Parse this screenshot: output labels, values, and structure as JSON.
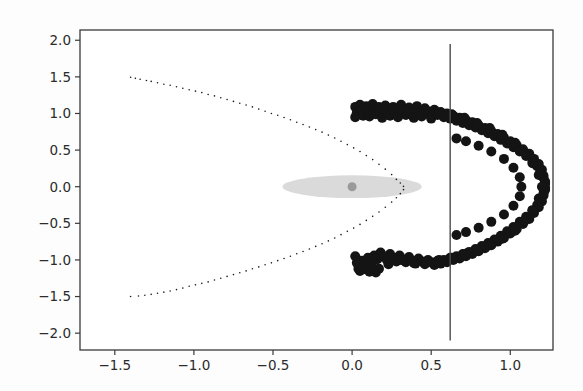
{
  "figure": {
    "background": "#fdfdfd",
    "width": 583,
    "height": 391,
    "frame_color": "#3a3a3a"
  },
  "chart_data": {
    "type": "scatter",
    "title": "",
    "xlabel": "",
    "ylabel": "",
    "xlim": [
      -1.72,
      1.27
    ],
    "ylim": [
      -2.23,
      2.14
    ],
    "grid": false,
    "legend": null,
    "xticks": [
      -1.5,
      -1.0,
      -0.5,
      0.0,
      0.5,
      1.0
    ],
    "xtick_labels": [
      "-1.5",
      "-1.0",
      "-0.5",
      "0.0",
      "0.5",
      "1.0"
    ],
    "yticks": [
      2.0,
      1.5,
      1.0,
      0.5,
      0.0,
      -0.5,
      -1.0,
      -1.5,
      -2.0
    ],
    "ytick_labels": [
      "2.0",
      "1.5",
      "1.0",
      "0.5",
      "0.0",
      "-0.5",
      "-1.0",
      "-1.5",
      "-2.0"
    ],
    "series": [
      {
        "name": "parabola-points",
        "marker": "small-dot",
        "color": "#1a1a1a",
        "size": 1.6,
        "description": "sparse small dots tracing a leftward-opening parabola x = 0.33 - 0.83*y^2",
        "points": [
          [
            -1.4,
            1.495
          ],
          [
            -1.37,
            1.48
          ],
          [
            -1.34,
            1.468
          ],
          [
            -1.3,
            1.45
          ],
          [
            -1.27,
            1.438
          ],
          [
            -1.23,
            1.42
          ],
          [
            -1.19,
            1.4
          ],
          [
            -1.15,
            1.385
          ],
          [
            -1.11,
            1.365
          ],
          [
            -1.07,
            1.345
          ],
          [
            -1.03,
            1.325
          ],
          [
            -0.99,
            1.305
          ],
          [
            -0.95,
            1.285
          ],
          [
            -0.91,
            1.26
          ],
          [
            -0.87,
            1.24
          ],
          [
            -0.83,
            1.215
          ],
          [
            -0.79,
            1.19
          ],
          [
            -0.75,
            1.165
          ],
          [
            -0.71,
            1.14
          ],
          [
            -0.67,
            1.115
          ],
          [
            -0.63,
            1.09
          ],
          [
            -0.59,
            1.06
          ],
          [
            -0.55,
            1.03
          ],
          [
            -0.51,
            1.0
          ],
          [
            -0.47,
            0.975
          ],
          [
            -0.43,
            0.945
          ],
          [
            -0.39,
            0.915
          ],
          [
            -0.35,
            0.88
          ],
          [
            -0.31,
            0.85
          ],
          [
            -0.27,
            0.815
          ],
          [
            -0.23,
            0.78
          ],
          [
            -0.19,
            0.745
          ],
          [
            -0.15,
            0.705
          ],
          [
            -0.11,
            0.665
          ],
          [
            -0.07,
            0.62
          ],
          [
            -0.03,
            0.575
          ],
          [
            0.01,
            0.53
          ],
          [
            0.05,
            0.48
          ],
          [
            0.09,
            0.425
          ],
          [
            0.13,
            0.37
          ],
          [
            0.17,
            0.305
          ],
          [
            0.21,
            0.24
          ],
          [
            0.25,
            0.165
          ],
          [
            0.28,
            0.1
          ],
          [
            0.305,
            0.05
          ],
          [
            0.325,
            0.005
          ],
          [
            0.325,
            -0.04
          ],
          [
            0.305,
            -0.095
          ],
          [
            0.28,
            -0.15
          ],
          [
            0.25,
            -0.21
          ],
          [
            0.21,
            -0.28
          ],
          [
            0.17,
            -0.345
          ],
          [
            0.13,
            -0.405
          ],
          [
            0.09,
            -0.46
          ],
          [
            0.05,
            -0.515
          ],
          [
            0.01,
            -0.565
          ],
          [
            -0.03,
            -0.61
          ],
          [
            -0.07,
            -0.655
          ],
          [
            -0.11,
            -0.7
          ],
          [
            -0.15,
            -0.74
          ],
          [
            -0.19,
            -0.78
          ],
          [
            -0.23,
            -0.815
          ],
          [
            -0.27,
            -0.85
          ],
          [
            -0.31,
            -0.885
          ],
          [
            -0.35,
            -0.915
          ],
          [
            -0.39,
            -0.95
          ],
          [
            -0.43,
            -0.98
          ],
          [
            -0.47,
            -1.01
          ],
          [
            -0.51,
            -1.04
          ],
          [
            -0.55,
            -1.065
          ],
          [
            -0.59,
            -1.095
          ],
          [
            -0.63,
            -1.12
          ],
          [
            -0.67,
            -1.15
          ],
          [
            -0.71,
            -1.175
          ],
          [
            -0.75,
            -1.2
          ],
          [
            -0.79,
            -1.225
          ],
          [
            -0.83,
            -1.25
          ],
          [
            -0.87,
            -1.275
          ],
          [
            -0.91,
            -1.3
          ],
          [
            -0.95,
            -1.32
          ],
          [
            -0.99,
            -1.34
          ],
          [
            -1.03,
            -1.36
          ],
          [
            -1.07,
            -1.385
          ],
          [
            -1.11,
            -1.405
          ],
          [
            -1.15,
            -1.425
          ],
          [
            -1.19,
            -1.44
          ],
          [
            -1.23,
            -1.455
          ],
          [
            -1.27,
            -1.47
          ],
          [
            -1.31,
            -1.482
          ],
          [
            -1.35,
            -1.492
          ],
          [
            -1.4,
            -1.5
          ]
        ]
      },
      {
        "name": "cluster-points",
        "marker": "large-filled-circle",
        "color": "#141414",
        "size": 10,
        "description": "dense C-shaped arc of large overlapping black markers opening to the left",
        "points": [
          [
            0.02,
            1.09
          ],
          [
            0.03,
            1.01
          ],
          [
            0.02,
            0.95
          ],
          [
            0.05,
            1.12
          ],
          [
            0.06,
            1.04
          ],
          [
            0.07,
            0.97
          ],
          [
            0.09,
            1.1
          ],
          [
            0.1,
            1.03
          ],
          [
            0.11,
            0.96
          ],
          [
            0.13,
            1.13
          ],
          [
            0.14,
            1.06
          ],
          [
            0.15,
            0.99
          ],
          [
            0.17,
            1.09
          ],
          [
            0.18,
            1.01
          ],
          [
            0.19,
            0.94
          ],
          [
            0.21,
            1.11
          ],
          [
            0.22,
            1.04
          ],
          [
            0.24,
            0.97
          ],
          [
            0.26,
            1.09
          ],
          [
            0.27,
            1.02
          ],
          [
            0.29,
            0.95
          ],
          [
            0.31,
            1.12
          ],
          [
            0.32,
            1.05
          ],
          [
            0.34,
            0.98
          ],
          [
            0.36,
            1.08
          ],
          [
            0.38,
            1.01
          ],
          [
            0.39,
            0.94
          ],
          [
            0.41,
            1.1
          ],
          [
            0.43,
            1.03
          ],
          [
            0.44,
            0.96
          ],
          [
            0.46,
            1.07
          ],
          [
            0.48,
            1.0
          ],
          [
            0.5,
            0.93
          ],
          [
            0.52,
            1.05
          ],
          [
            0.54,
            0.98
          ],
          [
            0.56,
            1.02
          ],
          [
            0.58,
            0.95
          ],
          [
            0.6,
            1.0
          ],
          [
            0.62,
            0.93
          ],
          [
            0.64,
            0.97
          ],
          [
            0.66,
            0.9
          ],
          [
            0.68,
            0.94
          ],
          [
            0.7,
            0.87
          ],
          [
            0.72,
            0.91
          ],
          [
            0.74,
            0.84
          ],
          [
            0.76,
            0.88
          ],
          [
            0.78,
            0.81
          ],
          [
            0.8,
            0.84
          ],
          [
            0.82,
            0.77
          ],
          [
            0.84,
            0.8
          ],
          [
            0.86,
            0.73
          ],
          [
            0.88,
            0.76
          ],
          [
            0.9,
            0.69
          ],
          [
            0.92,
            0.72
          ],
          [
            0.94,
            0.64
          ],
          [
            0.96,
            0.67
          ],
          [
            0.98,
            0.59
          ],
          [
            1.0,
            0.62
          ],
          [
            1.02,
            0.54
          ],
          [
            1.04,
            0.57
          ],
          [
            1.06,
            0.48
          ],
          [
            1.08,
            0.51
          ],
          [
            1.1,
            0.42
          ],
          [
            1.12,
            0.45
          ],
          [
            1.14,
            0.35
          ],
          [
            1.15,
            0.38
          ],
          [
            1.17,
            0.28
          ],
          [
            1.18,
            0.31
          ],
          [
            1.19,
            0.2
          ],
          [
            1.2,
            0.23
          ],
          [
            1.21,
            0.12
          ],
          [
            1.21,
            0.15
          ],
          [
            1.22,
            0.04
          ],
          [
            1.22,
            0.07
          ],
          [
            1.22,
            -0.04
          ],
          [
            1.22,
            -0.01
          ],
          [
            1.21,
            -0.12
          ],
          [
            1.21,
            -0.09
          ],
          [
            1.2,
            -0.2
          ],
          [
            1.19,
            -0.17
          ],
          [
            1.18,
            -0.28
          ],
          [
            1.17,
            -0.25
          ],
          [
            1.15,
            -0.36
          ],
          [
            1.14,
            -0.33
          ],
          [
            1.12,
            -0.44
          ],
          [
            1.1,
            -0.41
          ],
          [
            1.08,
            -0.51
          ],
          [
            1.06,
            -0.48
          ],
          [
            1.04,
            -0.58
          ],
          [
            1.02,
            -0.55
          ],
          [
            1.0,
            -0.64
          ],
          [
            0.98,
            -0.61
          ],
          [
            0.96,
            -0.7
          ],
          [
            0.94,
            -0.67
          ],
          [
            0.92,
            -0.75
          ],
          [
            0.9,
            -0.72
          ],
          [
            0.88,
            -0.8
          ],
          [
            0.86,
            -0.77
          ],
          [
            0.84,
            -0.84
          ],
          [
            0.82,
            -0.81
          ],
          [
            0.8,
            -0.88
          ],
          [
            0.78,
            -0.85
          ],
          [
            0.76,
            -0.92
          ],
          [
            0.74,
            -0.89
          ],
          [
            0.72,
            -0.95
          ],
          [
            0.7,
            -0.92
          ],
          [
            0.68,
            -0.98
          ],
          [
            0.66,
            -0.95
          ],
          [
            0.64,
            -1.0
          ],
          [
            0.62,
            -0.97
          ],
          [
            0.6,
            -1.03
          ],
          [
            0.58,
            -1.0
          ],
          [
            0.56,
            -1.05
          ],
          [
            0.54,
            -1.01
          ],
          [
            0.52,
            -1.07
          ],
          [
            0.5,
            -1.03
          ],
          [
            0.48,
            -1.0
          ],
          [
            0.46,
            -1.06
          ],
          [
            0.44,
            -1.02
          ],
          [
            0.42,
            -0.98
          ],
          [
            0.4,
            -1.05
          ],
          [
            0.38,
            -1.01
          ],
          [
            0.36,
            -0.96
          ],
          [
            0.34,
            -1.03
          ],
          [
            0.32,
            -0.99
          ],
          [
            0.3,
            -0.94
          ],
          [
            0.28,
            -1.02
          ],
          [
            0.26,
            -0.97
          ],
          [
            0.24,
            -0.92
          ],
          [
            0.22,
            -1.0
          ],
          [
            0.2,
            -0.95
          ],
          [
            0.18,
            -0.9
          ],
          [
            0.16,
            -0.99
          ],
          [
            0.14,
            -0.94
          ],
          [
            0.12,
            -1.05
          ],
          [
            0.1,
            -0.97
          ],
          [
            0.08,
            -1.08
          ],
          [
            0.06,
            -1.01
          ],
          [
            0.04,
            -1.12
          ],
          [
            0.03,
            -1.04
          ],
          [
            0.02,
            -0.95
          ],
          [
            0.05,
            -1.15
          ],
          [
            0.07,
            -1.09
          ],
          [
            0.09,
            -1.13
          ],
          [
            0.11,
            -1.16
          ],
          [
            0.13,
            -1.1
          ],
          [
            0.15,
            -1.17
          ],
          [
            0.17,
            -1.12
          ],
          [
            0.3,
            1.06
          ],
          [
            0.35,
            1.03
          ],
          [
            0.47,
            1.04
          ],
          [
            0.55,
            1.01
          ],
          [
            0.63,
            0.99
          ],
          [
            0.71,
            0.94
          ],
          [
            0.79,
            0.87
          ],
          [
            0.87,
            0.8
          ],
          [
            0.95,
            0.71
          ],
          [
            1.03,
            0.6
          ],
          [
            1.09,
            0.47
          ],
          [
            1.14,
            0.32
          ],
          [
            1.18,
            0.16
          ],
          [
            1.2,
            0.0
          ],
          [
            1.18,
            -0.16
          ],
          [
            1.14,
            -0.32
          ],
          [
            1.09,
            -0.47
          ],
          [
            1.03,
            -0.6
          ],
          [
            0.95,
            -0.71
          ],
          [
            0.87,
            -0.8
          ],
          [
            0.79,
            -0.87
          ],
          [
            0.71,
            -0.92
          ],
          [
            0.63,
            -0.97
          ],
          [
            0.55,
            -1.0
          ],
          [
            0.47,
            -1.02
          ],
          [
            0.39,
            -1.04
          ],
          [
            0.31,
            -1.0
          ],
          [
            0.23,
            -1.06
          ],
          [
            0.72,
            0.62
          ],
          [
            0.8,
            0.56
          ],
          [
            0.88,
            0.48
          ],
          [
            0.96,
            0.38
          ],
          [
            1.02,
            0.26
          ],
          [
            1.06,
            0.13
          ],
          [
            1.07,
            0.0
          ],
          [
            1.06,
            -0.13
          ],
          [
            1.02,
            -0.26
          ],
          [
            0.96,
            -0.38
          ],
          [
            0.88,
            -0.48
          ],
          [
            0.8,
            -0.56
          ],
          [
            0.72,
            -0.62
          ],
          [
            0.66,
            0.66
          ],
          [
            0.66,
            -0.66
          ]
        ]
      }
    ],
    "annotations": [
      {
        "name": "confidence-ellipse",
        "kind": "ellipse",
        "center": [
          0.0,
          0.0
        ],
        "width": 0.44,
        "height": 0.155,
        "color": "#d6d6d6",
        "opacity": 0.9
      },
      {
        "name": "center-marker",
        "kind": "point",
        "position": [
          0.0,
          0.0
        ],
        "color": "#9a9a9a",
        "size": 9
      },
      {
        "name": "vertical-threshold-line",
        "kind": "vline",
        "x": 0.62,
        "y_from": -2.1,
        "y_to": 1.95,
        "color": "#4a4a4a",
        "width": 1.4
      }
    ]
  }
}
